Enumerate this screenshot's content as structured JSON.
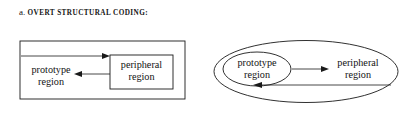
{
  "figure": {
    "type": "diagram",
    "background": "#ffffff",
    "stroke_color": "#1a1a1a",
    "text_color": "#141414",
    "panels": [
      {
        "id": "a",
        "letter": "a.",
        "caption": "OVERT STRUCTURAL CODING:",
        "shape_style": "rectangles",
        "outer_shape": "rectangle",
        "nodes": [
          {
            "id": "prototype",
            "label_line1": "prototype",
            "label_line2": "region",
            "boxed": false
          },
          {
            "id": "peripheral",
            "label_line1": "peripheral",
            "label_line2": "region",
            "boxed": true
          }
        ],
        "arrows": [
          {
            "from": "outer-boundary-left",
            "to": "peripheral",
            "direction": "right",
            "label": ""
          },
          {
            "from": "peripheral",
            "to": "prototype",
            "direction": "left",
            "label": ""
          }
        ]
      },
      {
        "id": "b",
        "letter": "b.",
        "caption": "BEHAVIORAL POTENTIAL:",
        "shape_style": "ellipses",
        "outer_shape": "ellipse",
        "nodes": [
          {
            "id": "prototype",
            "label_line1": "prototype",
            "label_line2": "region",
            "boxed": true
          },
          {
            "id": "peripheral",
            "label_line1": "peripheral",
            "label_line2": "region",
            "boxed": false
          }
        ],
        "arrows": [
          {
            "from": "prototype",
            "to": "peripheral",
            "direction": "right",
            "label": ""
          },
          {
            "from": "outer-boundary-right",
            "to": "prototype",
            "direction": "left",
            "label": ""
          }
        ]
      }
    ]
  }
}
